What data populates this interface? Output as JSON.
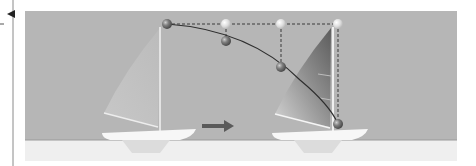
{
  "diagram": {
    "title": "",
    "colors": {
      "background": "#ffffff",
      "sky": "#b6b6b6",
      "water": "#efefef",
      "hull": "#f7f7f7",
      "keel": "#dcdcdc",
      "mast": "#f2f2f2",
      "curve": "#2e2e2e",
      "dashed": "#3a3a3a",
      "ball_dark": "#7a7a7a",
      "ball_light": "#d8d8d8",
      "arrow": "#5a5a5a",
      "side_line": "#8a8a8a"
    },
    "side_marker": {
      "arrow_icon": "left-pointing-triangle",
      "dash": "-"
    },
    "motion_arrow_icon": "right-arrow",
    "points": {
      "top_row": [
        {
          "x": 167,
          "y": 24,
          "tone": "dark"
        },
        {
          "x": 226,
          "y": 24,
          "tone": "light"
        },
        {
          "x": 281,
          "y": 24,
          "tone": "light"
        },
        {
          "x": 338,
          "y": 24,
          "tone": "light"
        }
      ],
      "curve_points": [
        {
          "x": 226,
          "y": 41,
          "tone": "dark"
        },
        {
          "x": 281,
          "y": 67,
          "tone": "dark"
        },
        {
          "x": 338,
          "y": 124,
          "tone": "dark"
        }
      ]
    },
    "boats": [
      {
        "position": "left",
        "state": "faded"
      },
      {
        "position": "right",
        "state": "shaded"
      }
    ]
  }
}
